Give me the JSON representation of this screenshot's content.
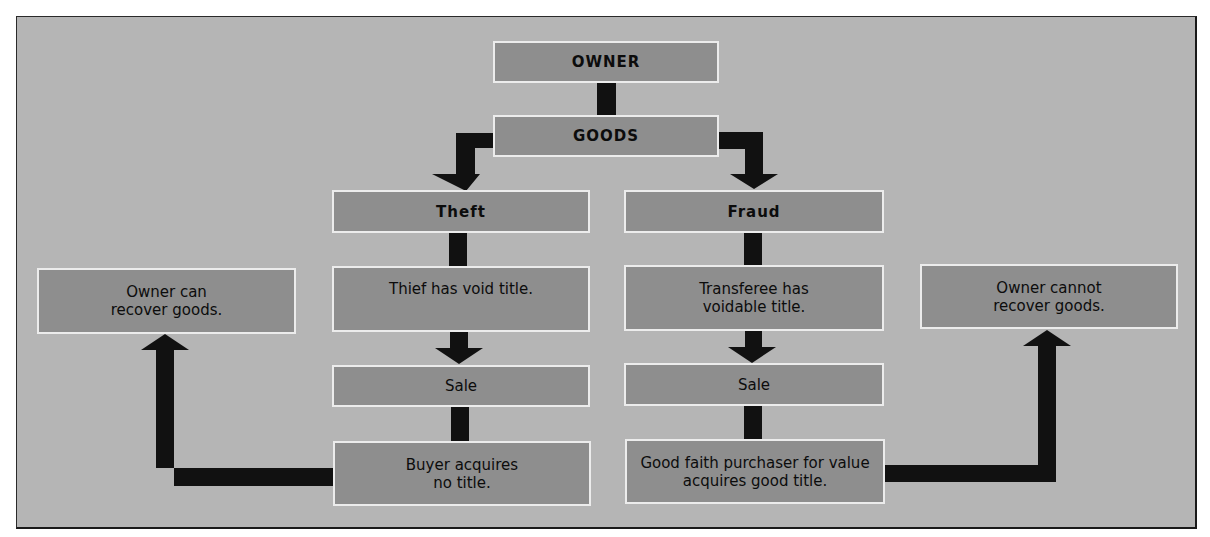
{
  "diagram": {
    "nodes": {
      "owner": "OWNER",
      "goods": "GOODS",
      "theft": "Theft",
      "fraud": "Fraud",
      "thief_void": "Thief has void title.",
      "transferee_voidable": "Transferee has voidable title.",
      "sale_left": "Sale",
      "sale_right": "Sale",
      "buyer_no_title": "Buyer acquires no title.",
      "good_faith": "Good faith purchaser for value acquires good title.",
      "owner_can": "Owner can recover goods.",
      "owner_cannot": "Owner cannot recover goods."
    },
    "edges": [
      {
        "from": "owner",
        "to": "goods"
      },
      {
        "from": "goods",
        "to": "theft"
      },
      {
        "from": "goods",
        "to": "fraud"
      },
      {
        "from": "theft",
        "to": "thief_void"
      },
      {
        "from": "thief_void",
        "to": "sale_left"
      },
      {
        "from": "sale_left",
        "to": "buyer_no_title"
      },
      {
        "from": "buyer_no_title",
        "to": "owner_can"
      },
      {
        "from": "fraud",
        "to": "transferee_voidable"
      },
      {
        "from": "transferee_voidable",
        "to": "sale_right"
      },
      {
        "from": "sale_right",
        "to": "good_faith"
      },
      {
        "from": "good_faith",
        "to": "owner_cannot"
      }
    ],
    "colors": {
      "background": "#b5b5b5",
      "box_fill": "#8e8e8e",
      "box_border": "#ececec",
      "connector": "#111111"
    }
  }
}
